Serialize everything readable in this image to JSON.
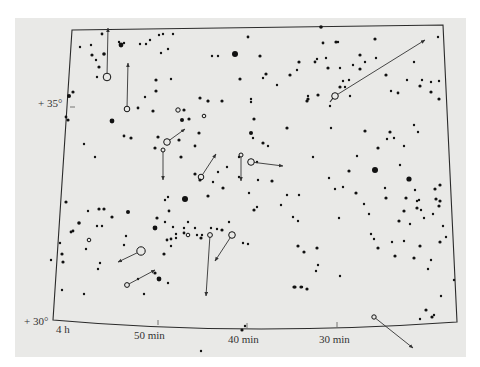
{
  "chart_data": {
    "type": "scatter",
    "title": "",
    "subtitle": "Star chart with proper-motion vectors",
    "xlabel": "Right ascension",
    "ylabel": "Declination",
    "x_ticks": [
      {
        "label": "4 h",
        "x": 64,
        "y": 333
      },
      {
        "label": "50 min",
        "x": 155,
        "y": 339
      },
      {
        "label": "40 min",
        "x": 247,
        "y": 344
      },
      {
        "label": "30 min",
        "x": 337,
        "y": 343
      }
    ],
    "y_ticks": [
      {
        "label": "+ 35°",
        "x": 26,
        "y": 107
      },
      {
        "label": "+ 30°",
        "x": 24,
        "y": 325
      }
    ],
    "grid": false,
    "legend": null,
    "frame": {
      "tl": [
        72,
        30
      ],
      "tr": [
        443,
        25
      ],
      "br": [
        457,
        322
      ],
      "bl": [
        53,
        320
      ],
      "bottom_mid": [
        242,
        329
      ]
    },
    "colors": {
      "paper": "#e9e9e7",
      "ink": "#111111",
      "frame": "#2a2a2a",
      "arrow": "#333333"
    },
    "stars": [
      [
        102,
        34,
        1.4
      ],
      [
        91,
        45,
        1.2
      ],
      [
        119,
        42,
        1.2
      ],
      [
        121,
        45,
        2.4
      ],
      [
        124,
        43,
        1.2
      ],
      [
        146,
        44,
        1.2
      ],
      [
        159,
        35,
        1.2
      ],
      [
        163,
        34,
        1.2
      ],
      [
        173,
        34,
        1.2
      ],
      [
        161,
        53,
        1.2
      ],
      [
        168,
        49,
        1.2
      ],
      [
        140,
        44,
        1.2
      ],
      [
        150,
        40,
        1.2
      ],
      [
        92,
        55,
        1.6
      ],
      [
        96,
        60,
        1.2
      ],
      [
        99,
        67,
        1.6
      ],
      [
        97,
        77,
        1.2
      ],
      [
        104,
        54,
        1.8
      ],
      [
        80,
        47,
        1.2
      ],
      [
        73,
        92,
        1.6
      ],
      [
        69,
        96,
        2
      ],
      [
        66,
        117,
        1.4
      ],
      [
        68,
        120,
        1.6
      ],
      [
        138,
        108,
        1.4
      ],
      [
        112,
        121,
        2.4
      ],
      [
        153,
        111,
        1.6
      ],
      [
        145,
        97,
        1.2
      ],
      [
        184,
        110,
        1.6
      ],
      [
        171,
        79,
        1.2
      ],
      [
        156,
        91,
        1.6
      ],
      [
        156,
        80,
        1.6
      ],
      [
        131,
        138,
        1.6
      ],
      [
        124,
        136,
        1.4
      ],
      [
        155,
        148,
        1.6
      ],
      [
        158,
        137,
        1.6
      ],
      [
        181,
        157,
        1.6
      ],
      [
        195,
        146,
        1.4
      ],
      [
        179,
        140,
        1.6
      ],
      [
        182,
        120,
        2
      ],
      [
        189,
        119,
        1.6
      ],
      [
        199,
        133,
        1.6
      ],
      [
        208,
        101,
        1.6
      ],
      [
        200,
        98,
        1.6
      ],
      [
        95,
        157,
        1.2
      ],
      [
        84,
        144,
        1.2
      ],
      [
        235,
        54,
        3
      ],
      [
        248,
        37,
        1.4
      ],
      [
        218,
        56,
        1.2
      ],
      [
        212,
        56,
        1.2
      ],
      [
        240,
        79,
        1.6
      ],
      [
        266,
        74,
        1.6
      ],
      [
        277,
        85,
        1.2
      ],
      [
        251,
        99,
        1.2
      ],
      [
        251,
        102,
        1.2
      ],
      [
        208,
        101,
        1.2
      ],
      [
        222,
        101,
        1.6
      ],
      [
        254,
        119,
        1.6
      ],
      [
        260,
        56,
        1.6
      ],
      [
        263,
        78,
        1.2
      ],
      [
        321,
        27,
        1.8
      ],
      [
        323,
        43,
        1.4
      ],
      [
        336,
        42,
        1.6
      ],
      [
        338,
        42,
        1.2
      ],
      [
        299,
        62,
        1.6
      ],
      [
        297,
        70,
        1.2
      ],
      [
        326,
        58,
        1.2
      ],
      [
        290,
        75,
        1.6
      ],
      [
        315,
        62,
        1.4
      ],
      [
        328,
        68,
        1.6
      ],
      [
        340,
        68,
        1.2
      ],
      [
        317,
        59,
        1.2
      ],
      [
        308,
        99,
        1.6
      ],
      [
        318,
        95,
        1.6
      ],
      [
        307,
        101,
        1.6
      ],
      [
        308,
        96,
        1.2
      ],
      [
        340,
        87,
        1.6
      ],
      [
        345,
        87,
        1.2
      ],
      [
        343,
        81,
        1.2
      ],
      [
        350,
        96,
        1.2
      ],
      [
        386,
        75,
        1.6
      ],
      [
        391,
        91,
        1.2
      ],
      [
        398,
        93,
        1.4
      ],
      [
        360,
        69,
        1.6
      ],
      [
        365,
        62,
        1.2
      ],
      [
        376,
        58,
        1.2
      ],
      [
        407,
        80,
        1.2
      ],
      [
        420,
        86,
        1.6
      ],
      [
        422,
        80,
        1.2
      ],
      [
        431,
        92,
        1.6
      ],
      [
        439,
        99,
        1.6
      ],
      [
        431,
        82,
        1.2
      ],
      [
        414,
        62,
        1.2
      ],
      [
        438,
        37,
        1.2
      ],
      [
        439,
        81,
        1.2
      ],
      [
        375,
        39,
        1.6
      ],
      [
        360,
        55,
        1.6
      ],
      [
        353,
        65,
        1.2
      ],
      [
        349,
        80,
        1.2
      ],
      [
        330,
        106,
        1.2
      ],
      [
        251,
        133,
        2
      ],
      [
        287,
        128,
        1.6
      ],
      [
        263,
        143,
        1.6
      ],
      [
        253,
        138,
        1.2
      ],
      [
        268,
        146,
        1.2
      ],
      [
        331,
        128,
        1.2
      ],
      [
        365,
        131,
        1.6
      ],
      [
        387,
        139,
        1.2
      ],
      [
        378,
        148,
        1.6
      ],
      [
        357,
        156,
        1.2
      ],
      [
        313,
        157,
        1.2
      ],
      [
        257,
        162,
        1.2
      ],
      [
        239,
        157,
        1.2
      ],
      [
        349,
        171,
        1.6
      ],
      [
        375,
        170,
        3
      ],
      [
        409,
        179,
        2.6
      ],
      [
        390,
        132,
        1.6
      ],
      [
        394,
        138,
        1.2
      ],
      [
        414,
        125,
        1.2
      ],
      [
        418,
        132,
        1.2
      ],
      [
        404,
        146,
        1.2
      ],
      [
        400,
        165,
        1.2
      ],
      [
        386,
        198,
        1.6
      ],
      [
        406,
        198,
        1.6
      ],
      [
        415,
        190,
        1.2
      ],
      [
        417,
        201,
        1.2
      ],
      [
        417,
        208,
        1.6
      ],
      [
        421,
        210,
        1.2
      ],
      [
        435,
        189,
        1.6
      ],
      [
        440,
        185,
        1.6
      ],
      [
        436,
        199,
        1.6
      ],
      [
        440,
        201,
        1.6
      ],
      [
        439,
        206,
        1.6
      ],
      [
        433,
        214,
        1.2
      ],
      [
        424,
        218,
        1.2
      ],
      [
        419,
        200,
        1.2
      ],
      [
        404,
        211,
        1.6
      ],
      [
        399,
        221,
        1.6
      ],
      [
        385,
        188,
        1.2
      ],
      [
        369,
        214,
        1.2
      ],
      [
        364,
        204,
        1.2
      ],
      [
        392,
        242,
        1.2
      ],
      [
        440,
        242,
        1.6
      ],
      [
        443,
        226,
        1.2
      ],
      [
        185,
        199,
        3
      ],
      [
        208,
        196,
        1.6
      ],
      [
        218,
        172,
        1.2
      ],
      [
        227,
        167,
        1.2
      ],
      [
        200,
        180,
        1.6
      ],
      [
        195,
        174,
        1.6
      ],
      [
        213,
        182,
        1.2
      ],
      [
        223,
        188,
        1.6
      ],
      [
        239,
        177,
        1.2
      ],
      [
        272,
        181,
        1.6
      ],
      [
        258,
        180,
        1.2
      ],
      [
        287,
        195,
        1.2
      ],
      [
        299,
        195,
        1.2
      ],
      [
        343,
        187,
        1.2
      ],
      [
        356,
        193,
        1.6
      ],
      [
        329,
        178,
        1.2
      ],
      [
        335,
        189,
        1.2
      ],
      [
        66,
        202,
        1.6
      ],
      [
        88,
        211,
        1.2
      ],
      [
        99,
        209,
        1.6
      ],
      [
        104,
        209,
        1.6
      ],
      [
        112,
        217,
        1.6
      ],
      [
        128,
        212,
        2
      ],
      [
        157,
        218,
        1.6
      ],
      [
        165,
        200,
        1.2
      ],
      [
        168,
        197,
        1.2
      ],
      [
        169,
        211,
        1.4
      ],
      [
        79,
        223,
        1.8
      ],
      [
        73,
        231,
        1.4
      ],
      [
        71,
        232,
        1.4
      ],
      [
        97,
        226,
        1.2
      ],
      [
        102,
        226,
        1.2
      ],
      [
        126,
        236,
        1.2
      ],
      [
        155,
        228,
        2.4
      ],
      [
        173,
        227,
        1.2
      ],
      [
        176,
        234,
        1.2
      ],
      [
        184,
        233,
        1.4
      ],
      [
        167,
        240,
        1.4
      ],
      [
        171,
        239,
        1.4
      ],
      [
        171,
        246,
        1.2
      ],
      [
        184,
        228,
        1.2
      ],
      [
        197,
        235,
        1.2
      ],
      [
        202,
        235,
        1.2
      ],
      [
        201,
        238,
        1.6
      ],
      [
        222,
        230,
        1.6
      ],
      [
        211,
        228,
        1.2
      ],
      [
        217,
        229,
        1.2
      ],
      [
        188,
        222,
        1.2
      ],
      [
        195,
        228,
        1.2
      ],
      [
        229,
        222,
        1.2
      ],
      [
        243,
        243,
        1.2
      ],
      [
        248,
        244,
        1.2
      ],
      [
        62,
        254,
        1.6
      ],
      [
        63,
        262,
        1.6
      ],
      [
        60,
        243,
        1.2
      ],
      [
        86,
        249,
        1.2
      ],
      [
        98,
        269,
        1.2
      ],
      [
        100,
        263,
        1.2
      ],
      [
        124,
        245,
        1.2
      ],
      [
        138,
        279,
        1.2
      ],
      [
        155,
        273,
        1.6
      ],
      [
        159,
        279,
        2.4
      ],
      [
        164,
        254,
        1.6
      ],
      [
        176,
        238,
        1.2
      ],
      [
        165,
        222,
        1.2
      ],
      [
        168,
        283,
        1.2
      ],
      [
        144,
        294,
        1.2
      ],
      [
        84,
        294,
        1.2
      ],
      [
        62,
        290,
        1.2
      ],
      [
        51,
        260,
        1.2
      ],
      [
        249,
        193,
        1.2
      ],
      [
        254,
        210,
        1.6
      ],
      [
        257,
        207,
        1.2
      ],
      [
        298,
        221,
        1.2
      ],
      [
        281,
        205,
        1.2
      ],
      [
        298,
        246,
        1.6
      ],
      [
        304,
        252,
        1.6
      ],
      [
        293,
        217,
        1.2
      ],
      [
        317,
        248,
        1.6
      ],
      [
        316,
        271,
        1.2
      ],
      [
        318,
        265,
        1.2
      ],
      [
        294,
        287,
        1.6
      ],
      [
        295,
        287,
        1.6
      ],
      [
        301,
        287,
        1.6
      ],
      [
        302,
        287,
        1.2
      ],
      [
        307,
        289,
        1.6
      ],
      [
        339,
        218,
        1.2
      ],
      [
        340,
        276,
        1.2
      ],
      [
        371,
        234,
        1.2
      ],
      [
        374,
        239,
        1.2
      ],
      [
        378,
        248,
        1.6
      ],
      [
        395,
        256,
        1.6
      ],
      [
        404,
        241,
        1.2
      ],
      [
        410,
        224,
        1.2
      ],
      [
        420,
        246,
        1.6
      ],
      [
        414,
        258,
        1.6
      ],
      [
        428,
        269,
        1.2
      ],
      [
        431,
        260,
        1.2
      ],
      [
        420,
        319,
        1.2
      ],
      [
        426,
        310,
        1.6
      ],
      [
        432,
        317,
        1.6
      ],
      [
        434,
        315,
        1.2
      ],
      [
        441,
        296,
        1.2
      ],
      [
        446,
        237,
        1.2
      ],
      [
        454,
        280,
        1.2
      ],
      [
        242,
        330,
        1.6
      ],
      [
        245,
        326,
        1.2
      ],
      [
        201,
        351,
        1.2
      ]
    ],
    "open_stars": [
      {
        "x": 107,
        "y": 77,
        "r": 3.8,
        "note": "motion arrow upward",
        "arrow_to": [
          108,
          28
        ]
      },
      {
        "x": 127,
        "y": 109,
        "r": 2.8,
        "arrow_to": [
          128,
          63
        ]
      },
      {
        "x": 178,
        "y": 110,
        "r": 2.2
      },
      {
        "x": 204,
        "y": 116,
        "r": 1.8
      },
      {
        "x": 167,
        "y": 142,
        "r": 3.3,
        "arrow_to": [
          185,
          129
        ]
      },
      {
        "x": 163,
        "y": 150,
        "r": 2,
        "arrow_to": [
          163,
          180
        ]
      },
      {
        "x": 201,
        "y": 177,
        "r": 2.8,
        "arrow_to": [
          216,
          154
        ]
      },
      {
        "x": 241,
        "y": 155,
        "r": 2,
        "arrow_to": [
          241,
          181
        ]
      },
      {
        "x": 251,
        "y": 162,
        "r": 3.3,
        "arrow_to": [
          283,
          166
        ]
      },
      {
        "x": 335,
        "y": 96,
        "r": 3.3,
        "arrow_to": [
          425,
          40
        ],
        "tail_to": [
          330,
          102
        ]
      },
      {
        "x": 89,
        "y": 240,
        "r": 1.8
      },
      {
        "x": 141,
        "y": 251,
        "r": 4.2,
        "arrow_to": [
          118,
          262
        ]
      },
      {
        "x": 127,
        "y": 285,
        "r": 2.4,
        "arrow_to": [
          155,
          270
        ]
      },
      {
        "x": 188,
        "y": 235,
        "r": 1.8
      },
      {
        "x": 210,
        "y": 235,
        "r": 2.4,
        "arrow_to": [
          206,
          296
        ]
      },
      {
        "x": 232,
        "y": 235,
        "r": 3.3,
        "arrow_to": [
          215,
          261
        ]
      },
      {
        "x": 374,
        "y": 317,
        "r": 2.2,
        "arrow_to": [
          413,
          348
        ]
      }
    ]
  }
}
